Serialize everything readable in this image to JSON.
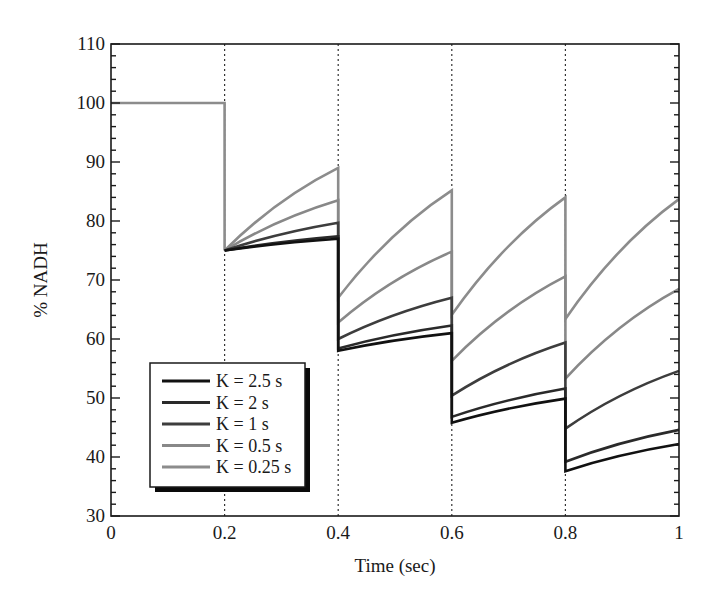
{
  "chart_data": {
    "type": "line",
    "title": "",
    "xlabel": "Time (sec)",
    "ylabel": "% NADH",
    "xlim": [
      0,
      1
    ],
    "ylim": [
      30,
      110
    ],
    "xticks": [
      "0",
      "0.2",
      "0.4",
      "0.6",
      "0.8",
      "1"
    ],
    "yticks": [
      "30",
      "40",
      "50",
      "60",
      "70",
      "80",
      "90",
      "100",
      "110"
    ],
    "grid": false,
    "vertical_dotted_lines_at": [
      0.2,
      0.4,
      0.6,
      0.8
    ],
    "legend_position": "lower left",
    "initial": {
      "x": [
        0,
        0.2
      ],
      "y": [
        100,
        100
      ]
    },
    "series": [
      {
        "name": "K = 2.5 s",
        "color": "#111111",
        "segments": [
          {
            "x0": 0.2,
            "y0": 75.0,
            "x1": 0.4,
            "y1": 77.0
          },
          {
            "x0": 0.4,
            "y0": 58.0,
            "x1": 0.6,
            "y1": 61.0
          },
          {
            "x0": 0.6,
            "y0": 45.8,
            "x1": 0.8,
            "y1": 49.9
          },
          {
            "x0": 0.8,
            "y0": 37.6,
            "x1": 1.0,
            "y1": 42.2
          }
        ]
      },
      {
        "name": "K = 2 s",
        "color": "#2a2a2a",
        "segments": [
          {
            "x0": 0.2,
            "y0": 75.0,
            "x1": 0.4,
            "y1": 77.4
          },
          {
            "x0": 0.4,
            "y0": 58.4,
            "x1": 0.6,
            "y1": 62.3
          },
          {
            "x0": 0.6,
            "y0": 46.8,
            "x1": 0.8,
            "y1": 51.6
          },
          {
            "x0": 0.8,
            "y0": 39.2,
            "x1": 1.0,
            "y1": 44.6
          }
        ]
      },
      {
        "name": "K = 1 s",
        "color": "#3d3d3d",
        "segments": [
          {
            "x0": 0.2,
            "y0": 75.0,
            "x1": 0.4,
            "y1": 79.7
          },
          {
            "x0": 0.4,
            "y0": 60.0,
            "x1": 0.6,
            "y1": 67.0
          },
          {
            "x0": 0.6,
            "y0": 50.4,
            "x1": 0.8,
            "y1": 59.4
          },
          {
            "x0": 0.8,
            "y0": 44.8,
            "x1": 1.0,
            "y1": 54.6
          }
        ]
      },
      {
        "name": "K = 0.5 s",
        "color": "#888888",
        "segments": [
          {
            "x0": 0.2,
            "y0": 75.0,
            "x1": 0.4,
            "y1": 83.5
          },
          {
            "x0": 0.4,
            "y0": 62.8,
            "x1": 0.6,
            "y1": 74.8
          },
          {
            "x0": 0.6,
            "y0": 56.3,
            "x1": 0.8,
            "y1": 70.6
          },
          {
            "x0": 0.8,
            "y0": 53.3,
            "x1": 1.0,
            "y1": 68.5
          }
        ]
      },
      {
        "name": "K = 0.25 s",
        "color": "#8c8c8c",
        "segments": [
          {
            "x0": 0.2,
            "y0": 75.0,
            "x1": 0.4,
            "y1": 89.0
          },
          {
            "x0": 0.4,
            "y0": 67.0,
            "x1": 0.6,
            "y1": 85.2
          },
          {
            "x0": 0.6,
            "y0": 64.1,
            "x1": 0.8,
            "y1": 84.0
          },
          {
            "x0": 0.8,
            "y0": 63.4,
            "x1": 1.0,
            "y1": 83.7
          }
        ]
      }
    ]
  },
  "legend": {
    "items": [
      {
        "label": "K = 2.5 s",
        "color": "#111111"
      },
      {
        "label": "K = 2 s",
        "color": "#2a2a2a"
      },
      {
        "label": "K = 1 s",
        "color": "#3d3d3d"
      },
      {
        "label": "K = 0.5 s",
        "color": "#888888"
      },
      {
        "label": "K = 0.25 s",
        "color": "#8c8c8c"
      }
    ]
  }
}
